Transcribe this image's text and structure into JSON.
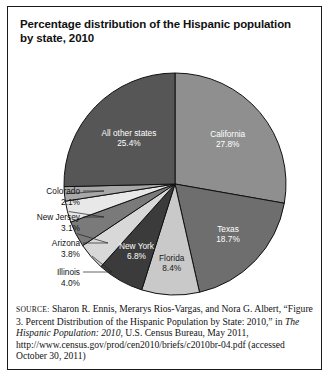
{
  "figure": {
    "title": "Percentage distribution of the Hispanic population by state, 2010"
  },
  "chart_data": {
    "type": "pie",
    "title": "Percentage distribution of the Hispanic population by state, 2010",
    "units": "percent",
    "start_angle_deg": 0,
    "direction": "clockwise",
    "categories": [
      "California",
      "Texas",
      "Florida",
      "New York",
      "Illinois",
      "Arizona",
      "New Jersey",
      "Colorado",
      "All other states"
    ],
    "values": [
      27.8,
      18.7,
      8.4,
      6.8,
      4.0,
      3.8,
      3.1,
      2.1,
      25.4
    ],
    "slices": [
      {
        "label": "California",
        "value": 27.8,
        "value_text": "27.8%",
        "color": "#8f8f8f",
        "label_placement": "inside",
        "label_fill": "light"
      },
      {
        "label": "Texas",
        "value": 18.7,
        "value_text": "18.7%",
        "color": "#6e6e6e",
        "label_placement": "inside",
        "label_fill": "light"
      },
      {
        "label": "Florida",
        "value": 8.4,
        "value_text": "8.4%",
        "color": "#c9c9c9",
        "label_placement": "inside",
        "label_fill": "dark"
      },
      {
        "label": "New York",
        "value": 6.8,
        "value_text": "6.8%",
        "color": "#3b3b3b",
        "label_placement": "inside",
        "label_fill": "light"
      },
      {
        "label": "Illinois",
        "value": 4.0,
        "value_text": "4.0%",
        "color": "#d8d8d8",
        "label_placement": "outside",
        "label_fill": "dark"
      },
      {
        "label": "Arizona",
        "value": 3.8,
        "value_text": "3.8%",
        "color": "#7a7a7a",
        "label_placement": "outside",
        "label_fill": "dark"
      },
      {
        "label": "New Jersey",
        "value": 3.1,
        "value_text": "3.1%",
        "color": "#e8e8e8",
        "label_placement": "outside",
        "label_fill": "dark"
      },
      {
        "label": "Colorado",
        "value": 2.1,
        "value_text": "2.1%",
        "color": "#a8a8a8",
        "label_placement": "outside",
        "label_fill": "dark"
      },
      {
        "label": "All other states",
        "value": 25.4,
        "value_text": "25.4%",
        "color": "#565656",
        "label_placement": "inside",
        "label_fill": "light"
      }
    ],
    "legend": "none",
    "grid": false
  },
  "outer_labels": [
    {
      "name": "colorado",
      "label": "Colorado",
      "value_text": "2.1%"
    },
    {
      "name": "new-jersey",
      "label": "New Jersey",
      "value_text": "3.1%"
    },
    {
      "name": "arizona",
      "label": "Arizona",
      "value_text": "3.8%"
    },
    {
      "name": "illinois",
      "label": "Illinois",
      "value_text": "4.0%"
    }
  ],
  "source": {
    "label": "SOURCE:",
    "line1": " Sharon R. Ennis, Merarys Rios-Vargas, and Nora G. Albert,",
    "line2": "“Figure 3. Percent Distribution of the Hispanic Population by State:",
    "line3_pre": "2010,” in ",
    "line3_italic": "The Hispanic Population: 2010",
    "line3_post": ", U.S. Census Bureau, May",
    "line4": "2011, http://www.census.gov/prod/cen2010/briefs/c2010br-04.pdf",
    "line5": "(accessed October 30, 2011)"
  }
}
